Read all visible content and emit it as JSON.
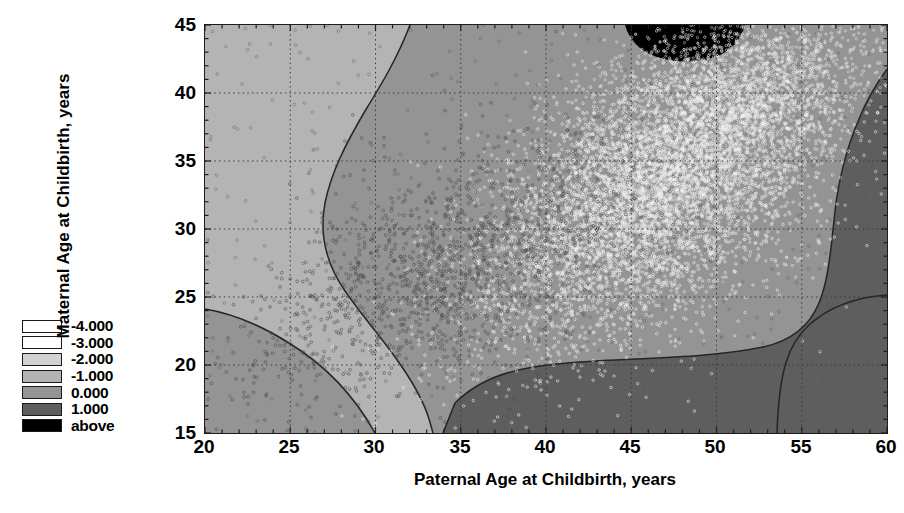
{
  "chart_data": {
    "type": "heatmap",
    "title": "",
    "xlabel": "Paternal Age at Childbirth, years",
    "ylabel": "Maternal Age at Childbirth, years",
    "xlim": [
      20,
      60
    ],
    "ylim": [
      15,
      45
    ],
    "xticks": [
      20,
      25,
      30,
      35,
      40,
      45,
      50,
      55,
      60
    ],
    "yticks": [
      15,
      20,
      25,
      30,
      35,
      40,
      45
    ],
    "grid": true,
    "grid_style": "dotted",
    "legend_position": "left-outside",
    "contour_levels": [
      -4.0,
      -3.0,
      -2.0,
      -1.0,
      0.0,
      1.0
    ],
    "overlay": "scatter points of individual births",
    "legend": {
      "entries": [
        {
          "label": "-4.000",
          "value": -4.0,
          "color": "#ffffff"
        },
        {
          "label": "-3.000",
          "value": -3.0,
          "color": "#ffffff"
        },
        {
          "label": "-2.000",
          "value": -2.0,
          "color": "#d2d2d2"
        },
        {
          "label": "-1.000",
          "value": -1.0,
          "color": "#b4b4b4"
        },
        {
          "label": "0.000",
          "value": 0.0,
          "color": "#949494"
        },
        {
          "label": "1.000",
          "value": 1.0,
          "color": "#5e5e5e"
        },
        {
          "label": "above",
          "value": null,
          "color": "#000000"
        }
      ]
    },
    "regions": [
      {
        "level": "-1.000",
        "fill": "#b4b4b4",
        "description": "upper-left lobe, low paternal age with high maternal age"
      },
      {
        "level": "0.000",
        "fill": "#949494",
        "description": "broad central band covering most of the plot"
      },
      {
        "level": "1.000",
        "fill": "#5e5e5e",
        "description": "large upper-right region of high density, plus a lobe in the lower-right corner"
      },
      {
        "level": "above",
        "fill": "#000000",
        "description": "small black patch at top edge near paternal age 46-49"
      }
    ]
  },
  "axes": {
    "x": {
      "title": "Paternal Age at Childbirth, years",
      "ticks": [
        "20",
        "25",
        "30",
        "35",
        "40",
        "45",
        "50",
        "55",
        "60"
      ]
    },
    "y": {
      "title": "Maternal Age at Childbirth, years",
      "ticks": [
        "45",
        "40",
        "35",
        "30",
        "25",
        "20",
        "15"
      ]
    }
  },
  "legend": {
    "items": [
      {
        "label": "-4.000",
        "color": "#ffffff"
      },
      {
        "label": "-3.000",
        "color": "#ffffff"
      },
      {
        "label": "-2.000",
        "color": "#d2d2d2"
      },
      {
        "label": "-1.000",
        "color": "#b4b4b4"
      },
      {
        "label": "0.000",
        "color": "#949494"
      },
      {
        "label": "1.000",
        "color": "#5e5e5e"
      },
      {
        "label": "above",
        "color": "#000000"
      }
    ]
  }
}
